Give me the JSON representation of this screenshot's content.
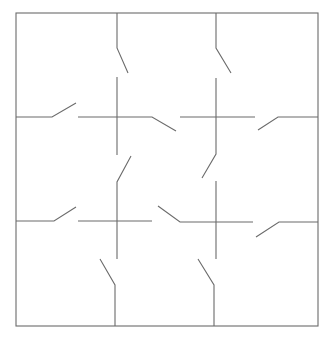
{
  "diagram": {
    "type": "switch-grid",
    "stroke_color": "#6b6b6b",
    "background": "#ffffff",
    "outer_box": {
      "x1": 16,
      "y1": 13,
      "x2": 318,
      "y2": 326
    },
    "segments": [
      {
        "name": "top-left-vertical-upper",
        "points": [
          [
            117,
            13
          ],
          [
            117,
            48
          ],
          [
            128,
            73
          ]
        ]
      },
      {
        "name": "top-right-vertical-upper",
        "points": [
          [
            216,
            13
          ],
          [
            216,
            48
          ],
          [
            231,
            73
          ]
        ]
      },
      {
        "name": "left-horizontal-upper",
        "points": [
          [
            16,
            117
          ],
          [
            52,
            117
          ],
          [
            76,
            103
          ]
        ]
      },
      {
        "name": "center-left-vertical-upper",
        "points": [
          [
            117,
            77
          ],
          [
            117,
            155
          ]
        ]
      },
      {
        "name": "center-left-horizontal-upper",
        "points": [
          [
            78,
            117
          ],
          [
            152,
            117
          ],
          [
            176,
            131
          ]
        ]
      },
      {
        "name": "center-right-vertical-upper",
        "points": [
          [
            216,
            78
          ],
          [
            216,
            154
          ],
          [
            202,
            178
          ]
        ]
      },
      {
        "name": "center-right-horizontal-upper",
        "points": [
          [
            180,
            117
          ],
          [
            255,
            117
          ]
        ]
      },
      {
        "name": "right-horizontal-upper",
        "points": [
          [
            318,
            117
          ],
          [
            278,
            117
          ],
          [
            258,
            130
          ]
        ]
      },
      {
        "name": "center-left-vertical-lower",
        "points": [
          [
            131,
            156
          ],
          [
            117,
            182
          ],
          [
            117,
            259
          ]
        ]
      },
      {
        "name": "left-horizontal-lower",
        "points": [
          [
            16,
            221
          ],
          [
            54,
            221
          ],
          [
            76,
            207
          ]
        ]
      },
      {
        "name": "center-left-horizontal-lower",
        "points": [
          [
            78,
            221
          ],
          [
            152,
            221
          ]
        ]
      },
      {
        "name": "center-right-horizontal-lower",
        "points": [
          [
            158,
            206
          ],
          [
            180,
            222
          ],
          [
            253,
            222
          ]
        ]
      },
      {
        "name": "center-right-vertical-lower",
        "points": [
          [
            216,
            181
          ],
          [
            216,
            259
          ]
        ]
      },
      {
        "name": "right-horizontal-lower",
        "points": [
          [
            318,
            222
          ],
          [
            279,
            222
          ],
          [
            256,
            237
          ]
        ]
      },
      {
        "name": "bottom-left-vertical",
        "points": [
          [
            100,
            259
          ],
          [
            115,
            285
          ],
          [
            115,
            326
          ]
        ]
      },
      {
        "name": "bottom-right-vertical",
        "points": [
          [
            198,
            259
          ],
          [
            214,
            285
          ],
          [
            214,
            326
          ]
        ]
      }
    ]
  }
}
